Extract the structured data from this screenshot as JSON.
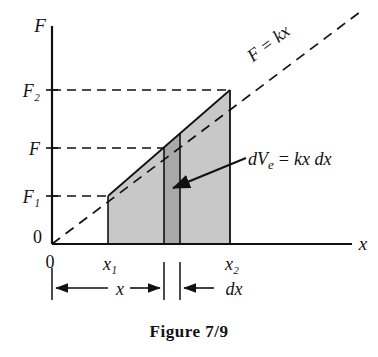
{
  "figure": {
    "caption": "Figure 7/9",
    "axes": {
      "y_axis_label": "F",
      "x_axis_label": "x",
      "origin_label_y": "0",
      "origin_label_x": "0"
    },
    "y_ticks": [
      {
        "label": "F₂",
        "value": "F2",
        "y_px": 90
      },
      {
        "label": "F",
        "value": "F",
        "y_px": 148
      },
      {
        "label": "F₁",
        "value": "F1",
        "y_px": 196
      }
    ],
    "x_ticks": [
      {
        "label": "x₁",
        "value": "x1",
        "x_px": 108
      },
      {
        "label": "x₂",
        "value": "x2",
        "x_px": 230
      }
    ],
    "line_label": "F = kx",
    "annotation_label": "dVₐ = kx dx",
    "annotation_label_parts": {
      "d": "d",
      "V": "V",
      "subscript": "e",
      "equals": "=",
      "rhs": "kx dx"
    },
    "dimension_labels": {
      "x_span": "x",
      "dx_span": "dx"
    },
    "colors": {
      "light_shade": "#c8c8c8",
      "dark_shade": "#a8a8a8",
      "stroke": "#111111",
      "background": "#ffffff"
    },
    "geometry": {
      "origin_x": 52,
      "origin_y": 244,
      "x1": 108,
      "strip_left": 164,
      "strip_right": 180,
      "x2": 230,
      "F1_y": 196,
      "F_y": 148,
      "F2_y": 90
    }
  }
}
